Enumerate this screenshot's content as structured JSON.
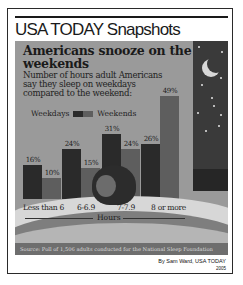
{
  "brand": "USA TODAY Snapshots",
  "headline": "Americans snooze on the weekends",
  "subtitle": "Number of hours adult Americans say they sleep on weekdays compared to the weekend:",
  "legend": {
    "weekdays": "Weekdays",
    "weekends": "Weekends"
  },
  "axis_label": "Hours",
  "source": "Source: Poll of 1,506 adults conducted for the National Sleep Foundation",
  "credit": "By Sam Ward, USA TODAY",
  "year": "2005",
  "colors": {
    "weekdays": "#2a2a2a",
    "weekends": "#5e5e5e",
    "panel": "#9a9a9a",
    "sky": "#3a3a3a"
  },
  "chart_data": {
    "type": "bar",
    "title": "Americans snooze on the weekends",
    "subtitle": "Number of hours adult Americans say they sleep on weekdays compared to the weekend:",
    "xlabel": "Hours",
    "ylabel": "",
    "categories": [
      "Less than 6",
      "6-6.9",
      "7-7.9",
      "8 or more"
    ],
    "series": [
      {
        "name": "Weekdays",
        "values": [
          16,
          24,
          31,
          26
        ]
      },
      {
        "name": "Weekends",
        "values": [
          10,
          15,
          24,
          49
        ]
      }
    ],
    "value_labels": {
      "Weekdays": [
        "16%",
        "24%",
        "31%",
        "26%"
      ],
      "Weekends": [
        "10%",
        "15%",
        "24%",
        "49%"
      ]
    },
    "ylim": [
      0,
      50
    ],
    "grid": false,
    "legend_position": "top-left",
    "source": "Source: Poll of 1,506 adults conducted for the National Sleep Foundation"
  }
}
